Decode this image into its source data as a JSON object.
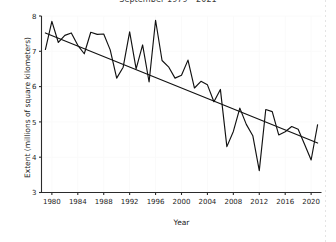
{
  "chart_data": {
    "type": "line",
    "title": "September 1979 - 2021",
    "xlabel": "Year",
    "ylabel": "Extent (millions of square kilometers)",
    "xlim": [
      1978.4,
      2021.6
    ],
    "ylim": [
      3,
      8
    ],
    "xticks": [
      1980,
      1984,
      1988,
      1992,
      1996,
      2000,
      2004,
      2008,
      2012,
      2016,
      2020
    ],
    "yticks": [
      3,
      4,
      5,
      6,
      7,
      8
    ],
    "grid": true,
    "legend": "none",
    "series": [
      {
        "name": "September sea ice extent",
        "x": [
          1979,
          1980,
          1981,
          1982,
          1983,
          1984,
          1985,
          1986,
          1987,
          1988,
          1989,
          1990,
          1991,
          1992,
          1993,
          1994,
          1995,
          1996,
          1997,
          1998,
          1999,
          2000,
          2001,
          2002,
          2003,
          2004,
          2005,
          2006,
          2007,
          2008,
          2009,
          2010,
          2011,
          2012,
          2013,
          2014,
          2015,
          2016,
          2017,
          2018,
          2019,
          2020,
          2021
        ],
        "values": [
          7.05,
          7.85,
          7.25,
          7.45,
          7.52,
          7.17,
          6.93,
          7.54,
          7.48,
          7.49,
          7.04,
          6.24,
          6.55,
          7.55,
          6.5,
          7.18,
          6.13,
          7.88,
          6.74,
          6.56,
          6.24,
          6.32,
          6.75,
          5.96,
          6.15,
          6.05,
          5.57,
          5.92,
          4.3,
          4.73,
          5.39,
          4.93,
          4.61,
          3.62,
          5.35,
          5.29,
          4.63,
          4.72,
          4.87,
          4.79,
          4.36,
          3.92,
          4.92
        ],
        "color": "#111111"
      }
    ],
    "trendline": {
      "name": "Linear trend",
      "x": [
        1979,
        2021
      ],
      "values": [
        7.52,
        4.4
      ],
      "color": "#111111"
    }
  }
}
